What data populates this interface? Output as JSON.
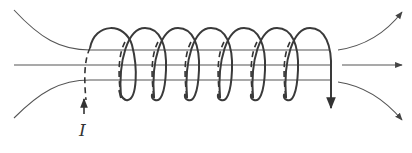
{
  "diagram": {
    "type": "solenoid-magnetic-field",
    "current_label": "I",
    "turns": 7,
    "colors": {
      "wire": "#3a3a3a",
      "field_line": "#4a4a4a",
      "background": "#ffffff"
    }
  }
}
